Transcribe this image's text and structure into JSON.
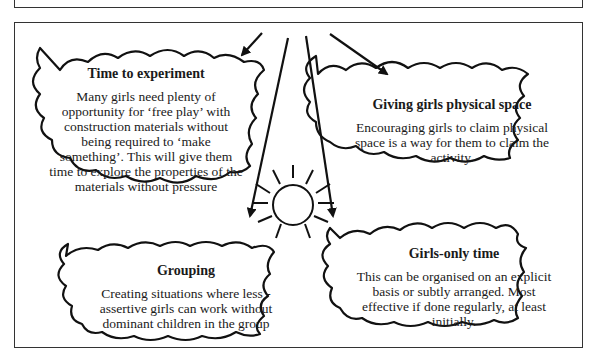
{
  "diagram": {
    "center": {
      "shape": "sun",
      "icon": "sun-icon"
    },
    "clouds": [
      {
        "id": "time-to-experiment",
        "title": "Time to experiment",
        "body": "Many girls need plenty of opportunity for ‘free play’ with construction materials without being required to ‘make something’. This will give them time to explore the properties of the materials without pressure"
      },
      {
        "id": "giving-girls-physical-space",
        "title": "Giving girls physical space",
        "body": "Encouraging girls to claim physical space is a way for them to claim the activity."
      },
      {
        "id": "grouping",
        "title": "Grouping",
        "body": "Creating situations where less - assertive girls can work without dominant children in the group"
      },
      {
        "id": "girls-only-time",
        "title": "Girls-only time",
        "body": "This can be organised on an explicit basis or subtly arranged. Most effective if done regularly, at least initially."
      }
    ],
    "colors": {
      "stroke": "#111111",
      "background": "#ffffff",
      "frame": "#333333"
    }
  }
}
